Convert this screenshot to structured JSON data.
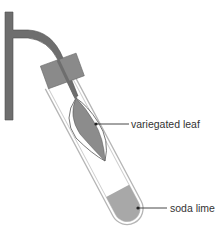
{
  "diagram": {
    "labels": {
      "leaf": "variegated leaf",
      "soda_lime": "soda lime"
    },
    "colors": {
      "stem": "#6e6e6e",
      "stopper": "#8a8a8a",
      "tube_outline": "#b5b5b5",
      "leaf_fill": "#8c8c8c",
      "leaf_outline": "#555555",
      "soda_lime": "#a8a8a8",
      "pointer": "#333333",
      "text": "#333333"
    }
  }
}
